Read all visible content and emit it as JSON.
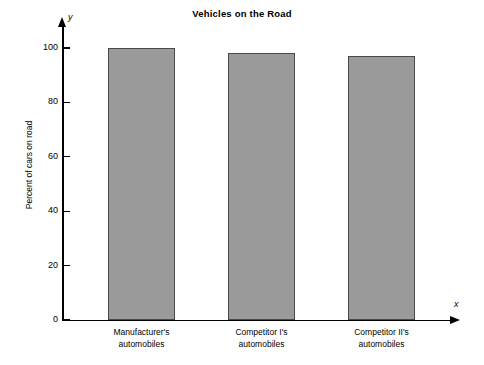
{
  "chart_data": {
    "type": "bar",
    "title": "Vehicles on the Road",
    "xlabel": "",
    "ylabel": "Percent of cars on road",
    "axis_names": {
      "x": "x",
      "y": "y"
    },
    "categories": [
      "Manufacturer's automobiles",
      "Competitor I's automobiles",
      "Competitor II's automobiles"
    ],
    "category_lines": [
      [
        "Manufacturer's",
        "automobiles"
      ],
      [
        "Competitor I's",
        "automobiles"
      ],
      [
        "Competitor II's",
        "automobiles"
      ]
    ],
    "values": [
      100,
      98,
      97
    ],
    "ylim": [
      0,
      100
    ],
    "yticks": [
      0,
      20,
      40,
      60,
      80,
      100
    ],
    "ytick_labels": [
      "0",
      "20",
      "40",
      "60",
      "80",
      "100"
    ],
    "grid": false,
    "legend": false,
    "bar_fill_color": "#9a9a9a",
    "bar_edge_color": "#4a4a4a",
    "axis_color": "#000000",
    "background_color": "#ffffff"
  }
}
